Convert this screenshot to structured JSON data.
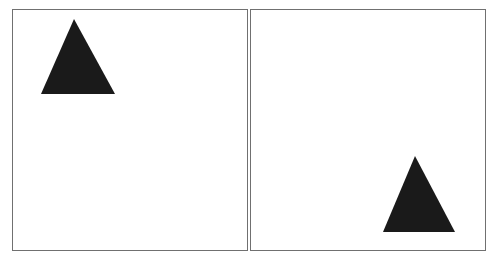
{
  "panels": [
    {
      "name": "left-panel",
      "shape": "triangle",
      "color": "#1a1a1a",
      "position": "top-left"
    },
    {
      "name": "right-panel",
      "shape": "triangle",
      "color": "#1a1a1a",
      "position": "bottom-right"
    }
  ]
}
